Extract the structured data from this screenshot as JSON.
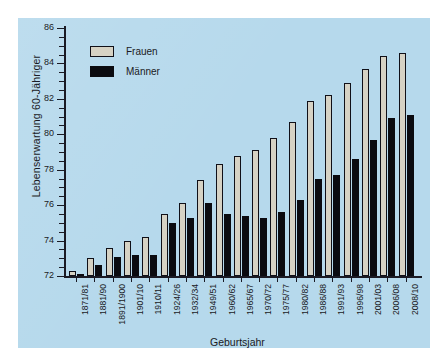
{
  "chart_data": {
    "type": "bar",
    "title": "",
    "xlabel": "Geburtsjahr",
    "ylabel": "Lebenserwartung 60-Jähriger",
    "ylim": [
      72,
      86
    ],
    "ytick_step": 2,
    "yticks": [
      72,
      74,
      76,
      78,
      80,
      82,
      84,
      86
    ],
    "minor_ticks": true,
    "grid": false,
    "legend_position": "top-left",
    "background_color": "#b6d9ec",
    "categories": [
      "1871/81",
      "1881/90",
      "1891/1900",
      "1901/10",
      "1910/11",
      "1924/26",
      "1932/34",
      "1949/51",
      "1960/62",
      "1965/67",
      "1970/72",
      "1975/77",
      "1980/82",
      "1986/88",
      "1991/93",
      "1996/98",
      "2001/03",
      "2006/08",
      "2008/10"
    ],
    "series": [
      {
        "name": "Frauen",
        "color": "#d6d2c4",
        "values": [
          72.3,
          73.0,
          73.6,
          74.0,
          74.2,
          75.5,
          76.1,
          77.4,
          78.3,
          78.8,
          79.1,
          79.8,
          80.7,
          81.9,
          82.2,
          82.9,
          83.7,
          84.4,
          84.6
        ]
      },
      {
        "name": "Männer",
        "color": "#0b0b10",
        "values": [
          72.1,
          72.6,
          73.1,
          73.2,
          73.2,
          75.0,
          75.3,
          76.1,
          75.5,
          75.4,
          75.3,
          75.6,
          76.3,
          77.5,
          77.7,
          78.6,
          79.7,
          80.9,
          81.1
        ]
      }
    ]
  },
  "legend": {
    "items": [
      {
        "label": "Frauen"
      },
      {
        "label": "Männer"
      }
    ]
  }
}
